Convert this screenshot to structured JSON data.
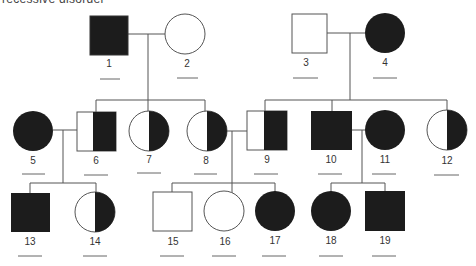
{
  "header": {
    "text": "recessive disorder"
  },
  "colors": {
    "affected": "#1c1c1c",
    "line": "#555555",
    "unaffected": "#ffffff"
  },
  "individuals": [
    {
      "id": "1",
      "sex": "male",
      "status": "affected"
    },
    {
      "id": "2",
      "sex": "female",
      "status": "unaffected"
    },
    {
      "id": "3",
      "sex": "male",
      "status": "unaffected"
    },
    {
      "id": "4",
      "sex": "female",
      "status": "affected"
    },
    {
      "id": "5",
      "sex": "female",
      "status": "affected"
    },
    {
      "id": "6",
      "sex": "male",
      "status": "half-shaded"
    },
    {
      "id": "7",
      "sex": "female",
      "status": "half-shaded"
    },
    {
      "id": "8",
      "sex": "female",
      "status": "half-shaded"
    },
    {
      "id": "9",
      "sex": "male",
      "status": "half-shaded"
    },
    {
      "id": "10",
      "sex": "male",
      "status": "affected"
    },
    {
      "id": "11",
      "sex": "female",
      "status": "affected"
    },
    {
      "id": "12",
      "sex": "female",
      "status": "half-shaded"
    },
    {
      "id": "13",
      "sex": "male",
      "status": "affected"
    },
    {
      "id": "14",
      "sex": "female",
      "status": "half-shaded"
    },
    {
      "id": "15",
      "sex": "male",
      "status": "unaffected"
    },
    {
      "id": "16",
      "sex": "female",
      "status": "unaffected"
    },
    {
      "id": "17",
      "sex": "female",
      "status": "affected"
    },
    {
      "id": "18",
      "sex": "female",
      "status": "affected"
    },
    {
      "id": "19",
      "sex": "male",
      "status": "affected"
    }
  ],
  "labels": {
    "n1": "1",
    "n2": "2",
    "n3": "3",
    "n4": "4",
    "n5": "5",
    "n6": "6",
    "n7": "7",
    "n8": "8",
    "n9": "9",
    "n10": "10",
    "n11": "11",
    "n12": "12",
    "n13": "13",
    "n14": "14",
    "n15": "15",
    "n16": "16",
    "n17": "17",
    "n18": "18",
    "n19": "19"
  }
}
